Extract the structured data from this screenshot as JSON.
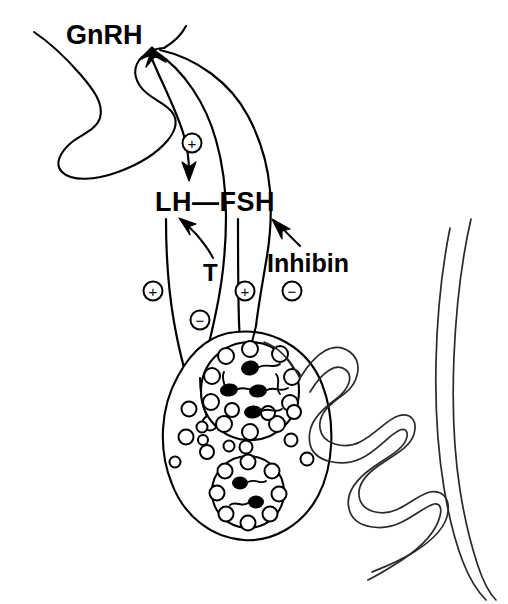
{
  "figure": {
    "name": "hypothalamic-pituitary-gonadal-axis",
    "background_color": "#ffffff",
    "ink_color": "#000000",
    "width": 508,
    "height": 604
  },
  "labels": {
    "gnrh": "GnRH",
    "lh_fsh": "LH—FSH",
    "testosterone": "T",
    "inhibin": "Inhibin"
  },
  "signs": {
    "plus": "+",
    "minus": "−",
    "stimulatory_gnrh_to_gonadotropins": "+",
    "stimulatory_left_gonadal": "+",
    "inhibitory_testosterone_feedback": "−",
    "stimulatory_right_gonadal": "+",
    "inhibitory_inhibin_feedback": "−"
  },
  "structures": {
    "hypothalamus": "hypothalamus-outline",
    "testis_cell": "sertoli-cell-body",
    "upper_nucleus": "upper-seminiferous-cross-section",
    "lower_nucleus": "lower-seminiferous-cross-section",
    "seminiferous_tubule": "coiled-seminiferous-tubule"
  },
  "caption": {
    "partial_text": ""
  }
}
